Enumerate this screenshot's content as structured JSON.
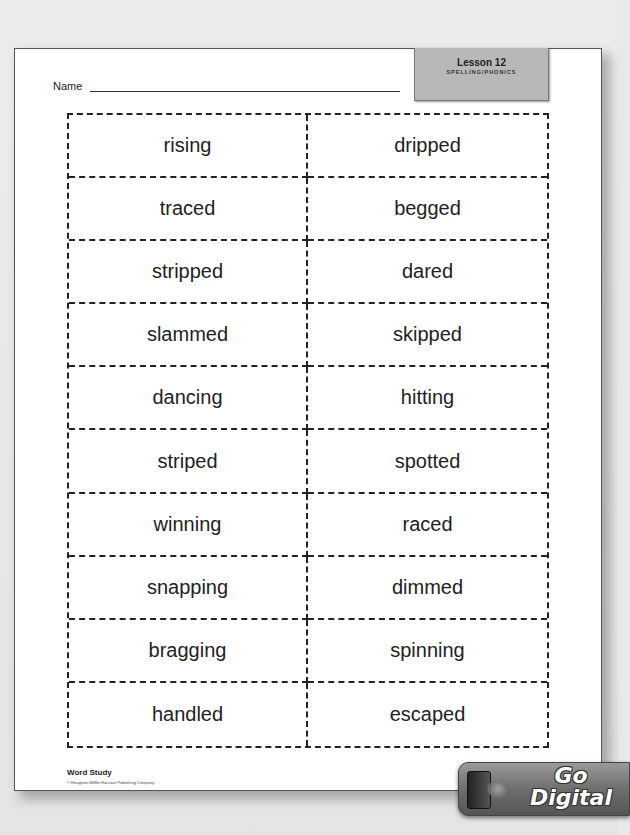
{
  "header": {
    "name_label": "Name",
    "lesson_title": "Lesson 12",
    "lesson_subtitle": "SPELLING/PHONICS"
  },
  "word_cards": [
    [
      "rising",
      "dripped"
    ],
    [
      "traced",
      "begged"
    ],
    [
      "stripped",
      "dared"
    ],
    [
      "slammed",
      "skipped"
    ],
    [
      "dancing",
      "hitting"
    ],
    [
      "striped",
      "spotted"
    ],
    [
      "winning",
      "raced"
    ],
    [
      "snapping",
      "dimmed"
    ],
    [
      "bragging",
      "spinning"
    ],
    [
      "handled",
      "escaped"
    ]
  ],
  "footer": {
    "section": "Word Study",
    "copyright": "© Houghton Mifflin Harcourt Publishing Company"
  },
  "badge": {
    "line1": "Go",
    "line2": "Digital"
  }
}
